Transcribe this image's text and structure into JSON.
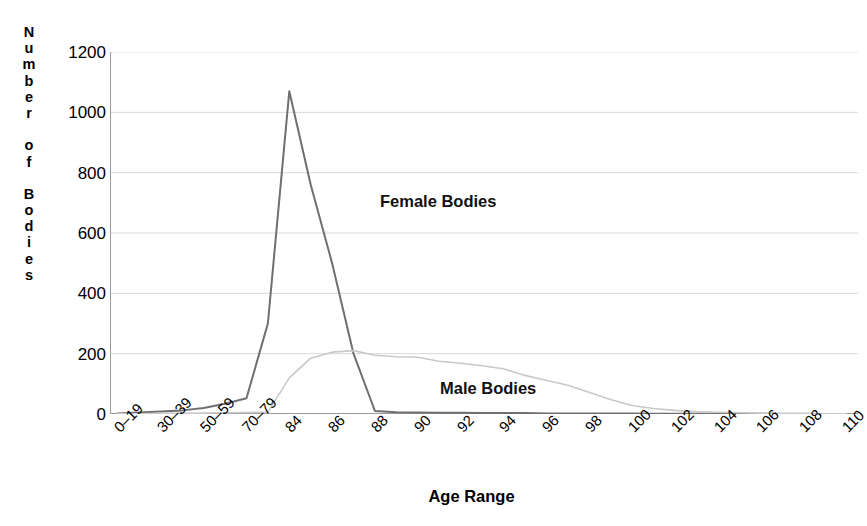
{
  "chart_data": {
    "type": "line",
    "title": "",
    "xlabel": "Age Range",
    "ylabel": "Number of Bodies",
    "ylabel_letters": [
      "N",
      "u",
      "m",
      "b",
      "e",
      "r",
      "",
      "o",
      "f",
      "",
      "B",
      "o",
      "d",
      "i",
      "e",
      "s"
    ],
    "ylim": [
      0,
      1200
    ],
    "y_ticks": [
      0,
      200,
      400,
      600,
      800,
      1000,
      1200
    ],
    "y_tick_labels": [
      "0",
      "200",
      "400",
      "600",
      "800",
      "1000",
      "1200"
    ],
    "grid": true,
    "grid_axis": "y",
    "legend_position": "inline-annotation",
    "categories": [
      "0–19",
      "20–29",
      "30–39",
      "40–49",
      "50–59",
      "60–69",
      "70–79",
      "80–83",
      "84",
      "85",
      "86",
      "87",
      "88",
      "89",
      "90",
      "91",
      "92",
      "93",
      "94",
      "95",
      "96",
      "97",
      "98",
      "99",
      "100",
      "101",
      "102",
      "103",
      "104",
      "105",
      "106",
      "107",
      "108",
      "109",
      "110"
    ],
    "x_tick_labels_shown": [
      "0–19",
      "30–39",
      "50–59",
      "70–79",
      "84",
      "86",
      "88",
      "90",
      "92",
      "94",
      "96",
      "98",
      "100",
      "102",
      "104",
      "106",
      "108",
      "110"
    ],
    "series": [
      {
        "name": "Female Bodies",
        "color": "#6f6f6f",
        "annotation": "Female Bodies",
        "values": [
          2,
          5,
          8,
          12,
          20,
          34,
          52,
          300,
          1070,
          760,
          500,
          200,
          10,
          6,
          5,
          4,
          4,
          3,
          3,
          3,
          2,
          2,
          2,
          2,
          2,
          1,
          1,
          1,
          1,
          1,
          1,
          0,
          0,
          0,
          0
        ]
      },
      {
        "name": "Male Bodies",
        "color": "#c9c9c9",
        "annotation": "Male Bodies",
        "values": [
          1,
          1,
          2,
          2,
          3,
          4,
          5,
          6,
          120,
          185,
          205,
          210,
          195,
          190,
          188,
          175,
          168,
          160,
          150,
          128,
          112,
          95,
          72,
          48,
          28,
          18,
          12,
          8,
          6,
          4,
          3,
          2,
          2,
          1,
          1
        ]
      }
    ],
    "peaks": {
      "female_peak_value": 1070,
      "female_peak_category": "84",
      "male_peak_value": 210,
      "male_peak_category": "87"
    }
  },
  "axis": {
    "x_title": "Age Range",
    "y_title": "Number of Bodies"
  }
}
